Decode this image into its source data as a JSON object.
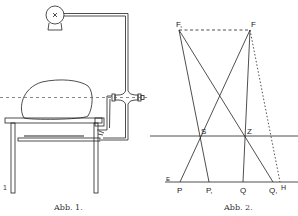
{
  "figures": [
    {
      "id": "fig1",
      "caption": "Abb. 1.",
      "corner_label": "1",
      "description": "Apparatus: pump connected by pipe to cross fitting beside table with object, lower shelf"
    },
    {
      "id": "fig2",
      "caption": "Abb. 2.",
      "points": {
        "F1": {
          "label": "F,",
          "x": 179,
          "y": 30
        },
        "F": {
          "label": "F",
          "x": 250,
          "y": 30
        },
        "S": {
          "label": "S",
          "x": 200,
          "y": 136
        },
        "Z": {
          "label": "Z",
          "x": 245,
          "y": 136
        },
        "P": {
          "label": "P",
          "x": 180,
          "y": 182
        },
        "P1": {
          "label": "P,",
          "x": 209,
          "y": 182
        },
        "Q": {
          "label": "Q",
          "x": 243,
          "y": 182
        },
        "Q1": {
          "label": "Q,",
          "x": 273,
          "y": 182
        },
        "H": {
          "label": "H",
          "x": 280,
          "y": 182
        },
        "E": {
          "label": "E",
          "x": 168,
          "y": 179
        }
      }
    }
  ],
  "colors": {
    "ink": "#222222",
    "paper": "#ffffff"
  }
}
